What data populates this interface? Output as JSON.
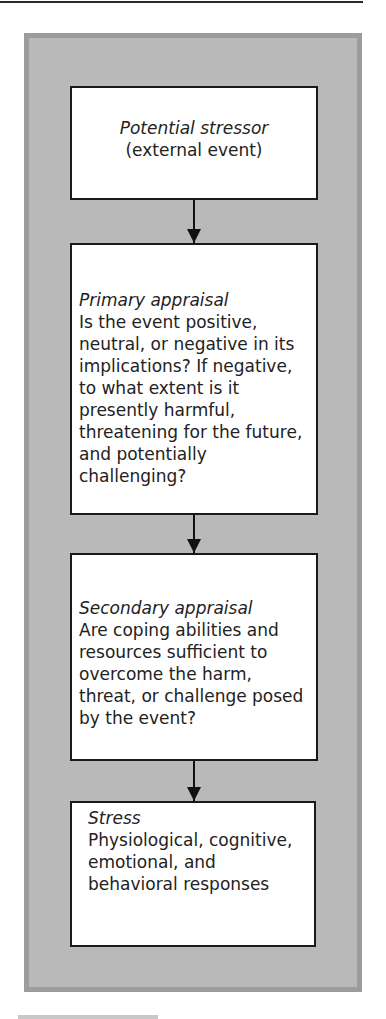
{
  "diagram": {
    "type": "flowchart",
    "direction": "top-to-bottom",
    "colors": {
      "frame_fill": "#b9b9b9",
      "frame_border": "#9c9c9c",
      "box_fill": "#ffffff",
      "box_border": "#1a1a1a",
      "arrow": "#111111"
    },
    "nodes": [
      {
        "id": "potential-stressor",
        "title": "Potential stressor",
        "body": "(external event)"
      },
      {
        "id": "primary-appraisal",
        "title": "Primary appraisal",
        "body": "Is the event positive, neutral, or negative in its implications? If negative, to what extent is it presently harmful, threatening for the future, and potentially challenging?"
      },
      {
        "id": "secondary-appraisal",
        "title": "Secondary appraisal",
        "body": "Are coping abilities and resources sufficient to overcome the harm, threat, or challenge posed by the event?"
      },
      {
        "id": "stress",
        "title": "Stress",
        "body": "Physiological, cognitive, emotional, and behavioral responses"
      }
    ],
    "edges": [
      {
        "from": "potential-stressor",
        "to": "primary-appraisal"
      },
      {
        "from": "primary-appraisal",
        "to": "secondary-appraisal"
      },
      {
        "from": "secondary-appraisal",
        "to": "stress"
      }
    ]
  }
}
